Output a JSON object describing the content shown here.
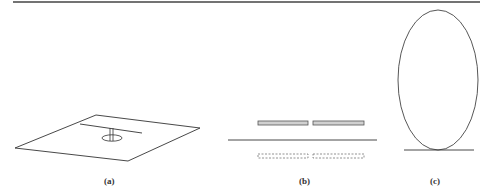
{
  "figure": {
    "panels": [
      {
        "id": "a",
        "label": "(a)",
        "description": "Planar dipole antenna above a ground plane with feed stem and loop"
      },
      {
        "id": "b",
        "label": "(b)",
        "description": "Side view: two solid strip elements above a ground line and their dashed image strips below"
      },
      {
        "id": "c",
        "label": "(c)",
        "description": "Elliptical loop resting on a ground line"
      }
    ]
  },
  "colors": {
    "stroke": "#333333",
    "rule": "#444444",
    "strip_fill": "#cccccc",
    "background": "#ffffff"
  }
}
